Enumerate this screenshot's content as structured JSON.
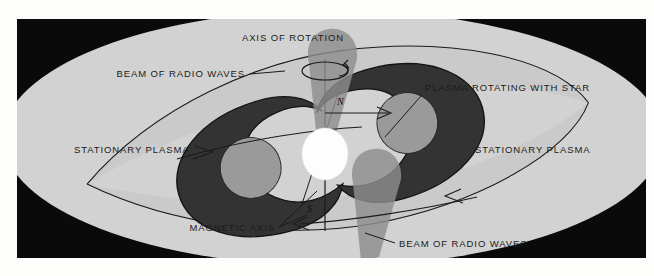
{
  "figure": {
    "frame": {
      "x": 17,
      "y": 19,
      "width": 629,
      "height": 239
    }
  },
  "colors": {
    "page_background": "#fdfdfb",
    "frame_background": "#0a0a0a",
    "stationary_plasma": "#d2d2d2",
    "rotating_plasma": "#c6c6c6",
    "magnetic_lobe_dark": "#333333",
    "lobe_inner_gray": "#999999",
    "star_white": "#fdfdfd",
    "beam_gray": "#8d8d8d",
    "label_text": "#1b1b1b"
  },
  "labels": {
    "axis_of_rotation": "AXIS OF ROTATION",
    "beam_top": "BEAM OF RADIO WAVES",
    "beam_bottom": "BEAM OF RADIO WAVES",
    "plasma_rotating": "PLASMA ROTATING WITH STAR",
    "stationary_plasma_left": "STATIONARY PLASMA",
    "stationary_plasma_right": "STATIONARY PLASMA",
    "magnetic_axis": "MAGNETIC AXIS",
    "pole_north": "N",
    "pole_south": "S"
  },
  "elements": {
    "star": {
      "cx": 325,
      "cy": 135,
      "rx": 22,
      "ry": 25
    },
    "rotation_axis": {
      "x": 325,
      "y_top": 48,
      "y_bottom": 211
    },
    "magnetic_axis_tilt_degrees": 17,
    "rotation_indicator": {
      "cx": 325,
      "cy": 52,
      "rx": 23,
      "ry": 9
    },
    "beams": [
      {
        "name": "beam-top-left",
        "direction": "upper-left"
      },
      {
        "name": "beam-bottom-right",
        "direction": "lower-right"
      }
    ],
    "sweep_arrows": [
      {
        "name": "sweep-arrow-top",
        "points": "right"
      },
      {
        "name": "sweep-arrow-rotation",
        "points": "right"
      },
      {
        "name": "sweep-arrow-bottom",
        "points": "left"
      }
    ]
  }
}
